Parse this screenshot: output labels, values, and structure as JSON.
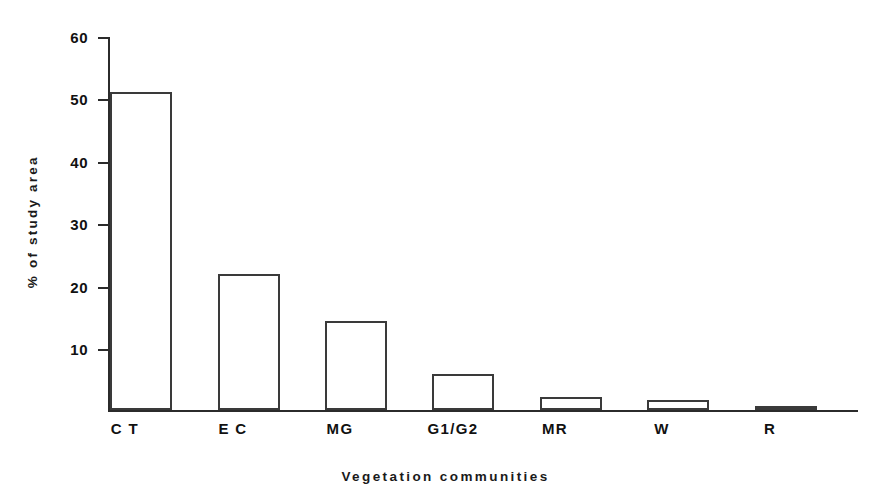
{
  "chart_data": {
    "type": "bar",
    "title": "",
    "subtitle": "",
    "xlabel": "Vegetation communities",
    "ylabel": "% of study area",
    "categories": [
      "C T",
      "E C",
      "MG",
      "G1/G2",
      "MR",
      "W",
      "R"
    ],
    "values": [
      52.2,
      22.3,
      14.6,
      5.9,
      2.1,
      1.6,
      0.4
    ],
    "series": [
      {
        "name": "% of study area",
        "values": [
          52.2,
          22.3,
          14.6,
          5.9,
          2.1,
          1.6,
          0.4
        ]
      }
    ],
    "ylim": [
      0,
      62
    ],
    "yticks": [
      10,
      20,
      30,
      40,
      50,
      60
    ],
    "ytick_labels": [
      "10",
      "20",
      "30",
      "40",
      "50",
      "60"
    ],
    "grid": false,
    "legend": null,
    "legend_position": "none",
    "bar_style": {
      "fill": "#ffffff",
      "edge": "#3a3a3a",
      "edge_width": 2
    },
    "axis_color": "#2b2b2b",
    "background": "#ffffff"
  }
}
